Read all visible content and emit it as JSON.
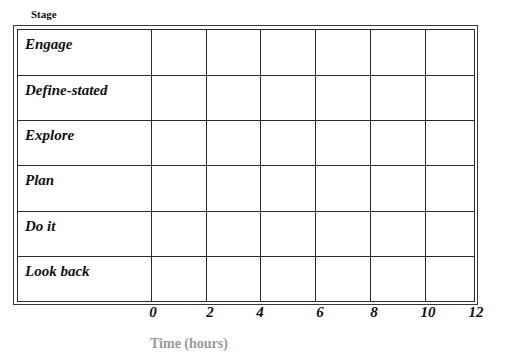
{
  "header": {
    "stage_label": "Stage"
  },
  "rows": [
    {
      "label": "Engage"
    },
    {
      "label": "Define-stated"
    },
    {
      "label": "Explore"
    },
    {
      "label": "Plan"
    },
    {
      "label": "Do it"
    },
    {
      "label": "Look back"
    }
  ],
  "x_axis": {
    "ticks": [
      "0",
      "2",
      "4",
      "6",
      "8",
      "10",
      "12"
    ]
  },
  "caption": {
    "text": "Time (hours)"
  },
  "colors": {
    "line": "#2a2a2a",
    "text": "#111111",
    "background": "#ffffff"
  }
}
